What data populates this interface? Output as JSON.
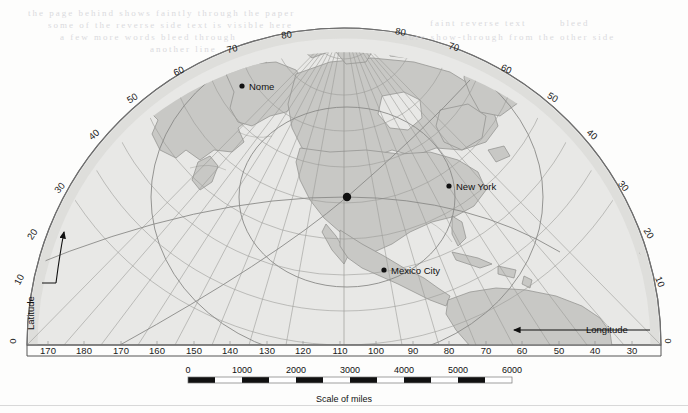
{
  "map": {
    "projection_note": "azimuthal hemispheric map of North America",
    "center_marker": "center-point-dot",
    "ocean_color": "#e9e9e7",
    "land_color": "#c9c9c6",
    "graticule_color": "#9a9a97",
    "frame_color": "#6e6e6e",
    "cities": [
      {
        "name": "Nome",
        "x": 242,
        "y": 86,
        "label_dx": 7,
        "label_dy": 3.5
      },
      {
        "name": "New York",
        "x": 449,
        "y": 186,
        "label_dx": 7,
        "label_dy": 3.5
      },
      {
        "name": "Mexico City",
        "x": 384,
        "y": 270,
        "label_dx": 7,
        "label_dy": 3.5
      }
    ],
    "latitude_axis": {
      "label": "Latitude",
      "ticks": [
        {
          "value": "0",
          "x": 16,
          "y": 341,
          "rot": -90
        },
        {
          "value": "10",
          "x": 22,
          "y": 281,
          "rot": -62
        },
        {
          "value": "20",
          "x": 35,
          "y": 236,
          "rot": -56
        },
        {
          "value": "30",
          "x": 62,
          "y": 190,
          "rot": -48
        },
        {
          "value": "40",
          "x": 96,
          "y": 137,
          "rot": -40
        },
        {
          "value": "50",
          "x": 134,
          "y": 101,
          "rot": -32
        },
        {
          "value": "60",
          "x": 180,
          "y": 74,
          "rot": -24
        },
        {
          "value": "70",
          "x": 233,
          "y": 52,
          "rot": -14
        },
        {
          "value": "80",
          "x": 287,
          "y": 38,
          "rot": -8
        },
        {
          "value": "80",
          "x": 400,
          "y": 35,
          "rot": 10
        },
        {
          "value": "70",
          "x": 453,
          "y": 50,
          "rot": 16
        },
        {
          "value": "60",
          "x": 505,
          "y": 72,
          "rot": 24
        },
        {
          "value": "50",
          "x": 551,
          "y": 100,
          "rot": 32
        },
        {
          "value": "40",
          "x": 590,
          "y": 137,
          "rot": 40
        },
        {
          "value": "30",
          "x": 621,
          "y": 188,
          "rot": 50
        },
        {
          "value": "20",
          "x": 646,
          "y": 235,
          "rot": 58
        },
        {
          "value": "10",
          "x": 657,
          "y": 283,
          "rot": 68
        },
        {
          "value": "0",
          "x": 665,
          "y": 341,
          "rot": 90
        }
      ]
    },
    "longitude_axis": {
      "label": "Longitude",
      "ticks": [
        {
          "value": "170",
          "x": 48
        },
        {
          "value": "180",
          "x": 84
        },
        {
          "value": "170",
          "x": 121
        },
        {
          "value": "160",
          "x": 157
        },
        {
          "value": "150",
          "x": 194
        },
        {
          "value": "140",
          "x": 230
        },
        {
          "value": "130",
          "x": 267
        },
        {
          "value": "120",
          "x": 303
        },
        {
          "value": "110",
          "x": 340
        },
        {
          "value": "100",
          "x": 376
        },
        {
          "value": "90",
          "x": 413
        },
        {
          "value": "80",
          "x": 449
        },
        {
          "value": "70",
          "x": 486
        },
        {
          "value": "60",
          "x": 522
        },
        {
          "value": "50",
          "x": 559
        },
        {
          "value": "40",
          "x": 595
        },
        {
          "value": "30",
          "x": 632
        }
      ]
    }
  },
  "scale": {
    "caption": "Scale of miles",
    "ticks": [
      "0",
      "1000",
      "2000",
      "3000",
      "4000",
      "5000",
      "6000"
    ],
    "bar_left": 188,
    "bar_right": 512,
    "segments": 12
  },
  "bleed_text": [
    {
      "x": 28,
      "y": 8,
      "text": "the page behind shows faintly through the paper"
    },
    {
      "x": 48,
      "y": 20,
      "text": "some of the reverse side text is visible here"
    },
    {
      "x": 60,
      "y": 32,
      "text": "a few more words bleed through"
    },
    {
      "x": 150,
      "y": 44,
      "text": "another line"
    },
    {
      "x": 430,
      "y": 18,
      "text": "faint reverse text"
    },
    {
      "x": 560,
      "y": 18,
      "text": "bleed"
    },
    {
      "x": 400,
      "y": 32,
      "text": "more show-through from the other side"
    }
  ]
}
